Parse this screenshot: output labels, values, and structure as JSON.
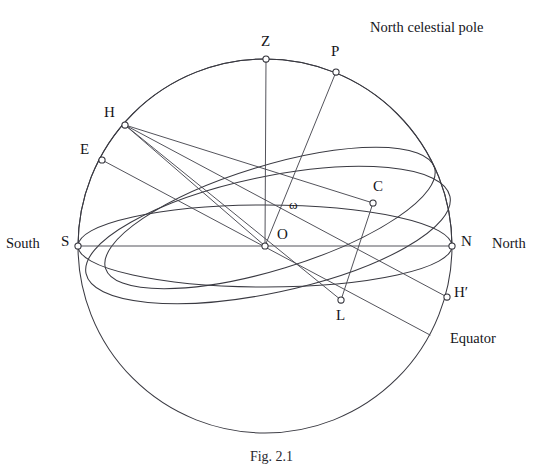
{
  "figure": {
    "caption": "Fig. 2.1",
    "background_color": "#ffffff",
    "line_color": "#3a3a42"
  },
  "annotations": {
    "north_celestial_pole": "North celestial pole",
    "south": "South",
    "north": "North",
    "equator": "Equator"
  },
  "points": [
    {
      "id": "Z",
      "label": "Z",
      "x": 266,
      "y": 59,
      "label_x": 261,
      "label_y": 34,
      "desc": "zenith"
    },
    {
      "id": "P",
      "label": "P",
      "x": 336,
      "y": 72,
      "label_x": 331,
      "label_y": 44,
      "desc": "north celestial pole"
    },
    {
      "id": "H",
      "label": "H",
      "x": 125,
      "y": 125,
      "label_x": 105,
      "label_y": 106,
      "desc": "rising point"
    },
    {
      "id": "E",
      "label": "E",
      "x": 102,
      "y": 160,
      "label_x": 80,
      "label_y": 143,
      "desc": "east point"
    },
    {
      "id": "C",
      "label": "C",
      "x": 373,
      "y": 203,
      "label_x": 373,
      "label_y": 180,
      "desc": "culmination point"
    },
    {
      "id": "O",
      "label": "O",
      "x": 265,
      "y": 246,
      "label_x": 277,
      "label_y": 228,
      "desc": "observer centre"
    },
    {
      "id": "S",
      "label": "S",
      "x": 78,
      "y": 246,
      "label_x": 61,
      "label_y": 234,
      "desc": "south point"
    },
    {
      "id": "N",
      "label": "N",
      "x": 452,
      "y": 246,
      "label_x": 461,
      "label_y": 234,
      "desc": "north point"
    },
    {
      "id": "L",
      "label": "L",
      "x": 341,
      "y": 300,
      "label_x": 336,
      "label_y": 308,
      "desc": "lower point"
    },
    {
      "id": "Hp",
      "label": "H′",
      "x": 447,
      "y": 297,
      "label_x": 455,
      "label_y": 285,
      "desc": "setting point"
    }
  ],
  "angle": {
    "symbol": "ω",
    "label_x": 289,
    "label_y": 196,
    "between": [
      "OZ",
      "OP"
    ]
  },
  "geometry": {
    "sphere": {
      "cx": 265,
      "cy": 246,
      "r": 187
    },
    "horizon_ellipse": {
      "cx": 265,
      "cy": 246,
      "rx": 187,
      "ry": 41,
      "rotate": 0
    },
    "equator_ellipse": {
      "cx": 265,
      "cy": 246,
      "rx": 185,
      "ry": 57,
      "rotate": -13
    },
    "ecliptic_ellipse": {
      "cx": 262,
      "cy": 212,
      "rx": 172,
      "ry": 50,
      "rotate": -17
    },
    "meridian_arc": {
      "from": "Z",
      "through": "S-N",
      "type": "vertical-great-circle"
    },
    "straight_lines": [
      [
        "S",
        "N"
      ],
      [
        "O",
        "Z"
      ],
      [
        "O",
        "P"
      ],
      [
        "H",
        "O"
      ],
      [
        "H",
        "L"
      ],
      [
        "H",
        "Hp"
      ],
      [
        "H",
        "C"
      ],
      [
        "E",
        "L"
      ],
      [
        "C",
        "L"
      ]
    ]
  }
}
